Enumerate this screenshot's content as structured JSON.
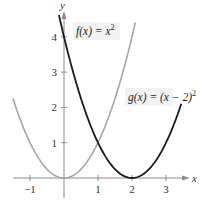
{
  "chart_data": {
    "type": "line",
    "title": "",
    "xlabel": "x",
    "ylabel": "y",
    "xlim": [
      -1.85,
      3.5
    ],
    "ylim": [
      -0.5,
      4.8
    ],
    "grid": false,
    "x_ticks": [
      -1,
      1,
      2,
      3
    ],
    "x_tick_labels": [
      "−1",
      "1",
      "2",
      "3"
    ],
    "y_ticks": [
      1,
      2,
      3,
      4
    ],
    "y_tick_labels": [
      "1",
      "2",
      "3",
      "4"
    ],
    "series": [
      {
        "name": "f(x) = x^2",
        "label": "f(x) = x",
        "label_exponent": "2",
        "color": "#a6a6a6",
        "expression": "x^2",
        "domain": [
          -1.5,
          2.1
        ],
        "x": [
          -1.5,
          -1,
          -0.5,
          0,
          0.5,
          1,
          1.5,
          2,
          2.1
        ],
        "values": [
          2.25,
          1,
          0.25,
          0,
          0.25,
          1,
          2.25,
          4,
          4.41
        ]
      },
      {
        "name": "g(x) = (x - 2)^2",
        "label": "g(x) = (x − 2)",
        "label_exponent": "2",
        "color": "#1a1a1a",
        "expression": "(x-2)^2",
        "domain": [
          -0.15,
          3.45
        ],
        "x": [
          -0.15,
          0,
          0.5,
          1,
          1.5,
          2,
          2.5,
          3,
          3.45
        ],
        "values": [
          4.62,
          4,
          2.25,
          1,
          0.25,
          0,
          0.25,
          1,
          2.1
        ]
      }
    ],
    "annotations": [
      {
        "text": "f(x) = x^2",
        "near_series": 0
      },
      {
        "text": "g(x) = (x − 2)^2",
        "near_series": 1
      }
    ]
  }
}
